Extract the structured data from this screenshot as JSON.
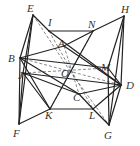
{
  "figure": {
    "type": "geometric-solid",
    "points": {
      "E": [
        33,
        15
      ],
      "H": [
        124,
        16
      ],
      "I": [
        49,
        31
      ],
      "N": [
        93,
        31
      ],
      "A": [
        64,
        46
      ],
      "B": [
        20,
        58
      ],
      "M": [
        108,
        68
      ],
      "O": [
        70,
        71
      ],
      "J": [
        23,
        73
      ],
      "D": [
        121,
        85
      ],
      "C": [
        79,
        94
      ],
      "K": [
        50,
        109
      ],
      "L": [
        93,
        109
      ],
      "F": [
        19,
        124
      ],
      "G": [
        109,
        125
      ]
    },
    "labels": [
      {
        "name": "E",
        "x": 27,
        "y": 12
      },
      {
        "name": "I",
        "x": 48,
        "y": 26
      },
      {
        "name": "N",
        "x": 88,
        "y": 28
      },
      {
        "name": "H",
        "x": 121,
        "y": 13
      },
      {
        "name": "A",
        "x": 58,
        "y": 47
      },
      {
        "name": "B",
        "x": 8,
        "y": 62
      },
      {
        "name": "O",
        "x": 61,
        "y": 77
      },
      {
        "name": "M",
        "x": 101,
        "y": 71
      },
      {
        "name": "J",
        "x": 18,
        "y": 79
      },
      {
        "name": "D",
        "x": 126,
        "y": 89
      },
      {
        "name": "C",
        "x": 73,
        "y": 101
      },
      {
        "name": "K",
        "x": 45,
        "y": 119
      },
      {
        "name": "L",
        "x": 89,
        "y": 119
      },
      {
        "name": "F",
        "x": 13,
        "y": 137
      },
      {
        "name": "G",
        "x": 104,
        "y": 139
      }
    ],
    "solid_edges": [
      [
        "E",
        "I"
      ],
      [
        "I",
        "N"
      ],
      [
        "N",
        "H"
      ],
      [
        "E",
        "B"
      ],
      [
        "E",
        "F"
      ],
      [
        "B",
        "F"
      ],
      [
        "J",
        "F"
      ],
      [
        "H",
        "D"
      ],
      [
        "H",
        "G"
      ],
      [
        "D",
        "G"
      ],
      [
        "M",
        "G"
      ],
      [
        "I",
        "D"
      ],
      [
        "N",
        "K"
      ],
      [
        "B",
        "A"
      ],
      [
        "A",
        "N"
      ],
      [
        "A",
        "D"
      ],
      [
        "B",
        "K"
      ],
      [
        "K",
        "L"
      ],
      [
        "K",
        "F"
      ],
      [
        "L",
        "G"
      ],
      [
        "L",
        "D"
      ],
      [
        "B",
        "C"
      ],
      [
        "C",
        "D"
      ],
      [
        "E",
        "J"
      ],
      [
        "J",
        "D"
      ],
      [
        "J",
        "C"
      ],
      [
        "C",
        "L"
      ],
      [
        "B",
        "M"
      ],
      [
        "M",
        "D"
      ],
      [
        "H",
        "M"
      ],
      [
        "J",
        "K"
      ]
    ],
    "hidden_edges": [
      [
        "B",
        "D"
      ],
      [
        "I",
        "L"
      ],
      [
        "N",
        "K"
      ],
      [
        "A",
        "C"
      ],
      [
        "J",
        "M"
      ],
      [
        "E",
        "O"
      ],
      [
        "O",
        "G"
      ]
    ]
  }
}
